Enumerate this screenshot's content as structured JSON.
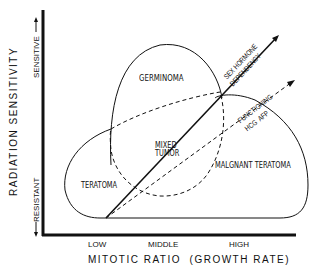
{
  "diagram": {
    "y_axis": {
      "title": "RADIATION SENSITIVITY",
      "top_label": "SENSITIVE",
      "bottom_label": "RESISTANT"
    },
    "x_axis": {
      "title": "MITOTIC RATIO  (GROWTH RATE)",
      "ticks": [
        "LOW",
        "MIDDLE",
        "HIGH"
      ]
    },
    "regions": {
      "germinoma": "GERMINOMA",
      "mixed_tumor_line1": "MIXED",
      "mixed_tumor_line2": "TUMOR",
      "teratoma": "TERATOMA",
      "malignant_teratoma": "MALGNANT TERATOMA"
    },
    "arrows": {
      "sex_hormone_line1": "SEX HORMONE",
      "sex_hormone_line2": "DEPENDENCY",
      "functioning_line1": "FUNCTIONING",
      "functioning_line2": "HCG  AFP"
    },
    "colors": {
      "ink": "#111111",
      "background": "#ffffff"
    }
  }
}
